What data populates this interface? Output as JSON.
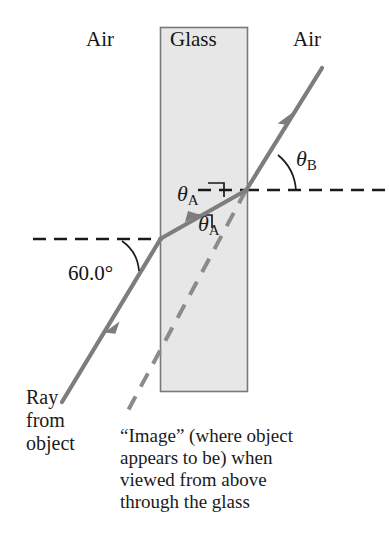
{
  "figure": {
    "type": "physics-optics-refraction-diagram",
    "width": 389,
    "height": 537,
    "background_color": "#ffffff"
  },
  "media_labels": {
    "left_air": "Air",
    "glass": "Glass",
    "right_air": "Air"
  },
  "angles": {
    "incidence_label": "60.0°",
    "theta_a_symbol": "θ",
    "theta_a_subscript": "A",
    "theta_b_symbol": "θ",
    "theta_b_subscript": "B"
  },
  "annotations": {
    "ray_source_line1": "Ray",
    "ray_source_line2": "from",
    "ray_source_line3": "object",
    "caption_line1": "“Image” (where object",
    "caption_line2": "appears to be) when",
    "caption_line3": "viewed from above",
    "caption_line4": "through the glass"
  },
  "colors": {
    "glass_fill": "#e6e6e6",
    "glass_stroke": "#6e6e6e",
    "ray_gray": "#7d7d7d",
    "dashed_black": "#1a1a1a",
    "text": "#141414"
  },
  "geometry": {
    "glass_slab": {
      "x": 160,
      "y": 27,
      "width": 88,
      "height": 365
    },
    "incoming_ray": {
      "x1": 62,
      "y1": 402,
      "x2": 160,
      "y2": 239
    },
    "ray_in_glass": {
      "x1": 160,
      "y1": 239,
      "x2": 246,
      "y2": 190
    },
    "exit_ray": {
      "x1": 246,
      "y1": 190,
      "x2": 322,
      "y2": 68
    },
    "image_dashed_ray": {
      "x1": 246,
      "y1": 190,
      "x2": 124,
      "y2": 418
    },
    "normal_left": {
      "x1": 33,
      "y1": 239,
      "x2": 163,
      "y2": 239
    },
    "normal_right": {
      "x1": 246,
      "y1": 190,
      "x2": 386,
      "y2": 190
    },
    "normal_glass_inner": {
      "x1": 198,
      "y1": 190,
      "x2": 248,
      "y2": 190
    }
  }
}
